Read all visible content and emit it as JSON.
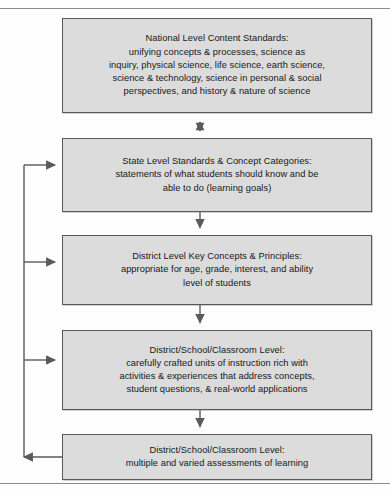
{
  "diagram": {
    "page_rules": {
      "top": true,
      "bottom": true
    },
    "style": {
      "box_fill": "#dcdcdc",
      "box_border": "#595959",
      "connector": "#5a5a5a",
      "text": "#17181a",
      "page_background": "#fefefe"
    },
    "nodes": [
      {
        "id": "national-level-content-standards",
        "text": "National Level Content Standards:\nunifying concepts & processes, science as\ninquiry, physical science, life science, earth science,\nscience & technology, science in personal & social\nperspectives, and history & nature of science"
      },
      {
        "id": "state-level-standards",
        "text": "State Level Standards & Concept Categories:\nstatements of what students should know and be\nable to do (learning goals)"
      },
      {
        "id": "district-level-key-concepts",
        "text": "District Level Key Concepts & Principles:\nappropriate for age, grade, interest, and ability\nlevel of students"
      },
      {
        "id": "district-school-classroom-instruction",
        "text": "District/School/Classroom Level:\ncarefully crafted units of instruction rich with\nactivities & experiences that address concepts,\nstudent questions, & real-world applications"
      },
      {
        "id": "district-school-classroom-assessment",
        "text": "District/School/Classroom Level:\nmultiple and varied assessments of learning"
      }
    ],
    "connectors": [
      {
        "id": "national-to-state",
        "from": "state-level-standards",
        "to": "national-level-content-standards",
        "direction": "bidirectional",
        "orientation": "vertical"
      },
      {
        "id": "state-to-district",
        "from": "state-level-standards",
        "to": "district-level-key-concepts",
        "direction": "down",
        "orientation": "vertical"
      },
      {
        "id": "district-to-instruction",
        "from": "district-level-key-concepts",
        "to": "district-school-classroom-instruction",
        "direction": "down",
        "orientation": "vertical"
      },
      {
        "id": "instruction-to-assessment",
        "from": "district-school-classroom-instruction",
        "to": "district-school-classroom-assessment",
        "direction": "down",
        "orientation": "vertical"
      },
      {
        "id": "assessment-feedback-loop",
        "from": "district-school-classroom-assessment",
        "to": "state-level-standards, district-level-key-concepts, district-school-classroom-instruction",
        "direction": "left-then-up-then-right",
        "orientation": "feedback-loop"
      }
    ]
  }
}
